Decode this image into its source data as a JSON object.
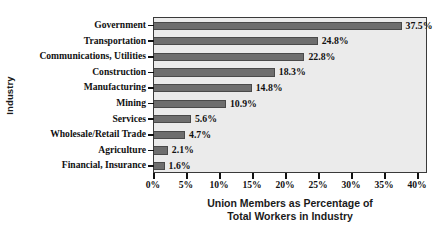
{
  "chart_data": {
    "type": "bar",
    "orientation": "horizontal",
    "title": "",
    "xlabel_line1": "Union Members as Percentage of",
    "xlabel_line2": "Total Workers in Industry",
    "ylabel": "Industry",
    "categories": [
      "Government",
      "Transportation",
      "Communications, Utilities",
      "Construction",
      "Manufacturing",
      "Mining",
      "Services",
      "Wholesale/Retail Trade",
      "Agriculture",
      "Financial, Insurance"
    ],
    "values": [
      37.5,
      24.8,
      22.8,
      18.3,
      14.8,
      10.9,
      5.6,
      4.7,
      2.1,
      1.6
    ],
    "value_labels": [
      "37.5%",
      "24.8%",
      "22.8%",
      "18.3%",
      "14.8%",
      "10.9%",
      "5.6%",
      "4.7%",
      "2.1%",
      "1.6%"
    ],
    "xlim": [
      0,
      40
    ],
    "xticks": [
      0,
      5,
      10,
      15,
      20,
      25,
      30,
      35,
      40
    ],
    "xtick_labels": [
      "0%",
      "5%",
      "10%",
      "15%",
      "20%",
      "25%",
      "30%",
      "35%",
      "40%"
    ],
    "grid": false,
    "legend": null,
    "colors": {
      "bar_fill": "#6e6e6e",
      "bar_edge": "#4a4a4a",
      "plot_background": "#ebebeb",
      "frame": "#3a3a3a",
      "text": "#111111",
      "page_background": "#ffffff"
    }
  }
}
